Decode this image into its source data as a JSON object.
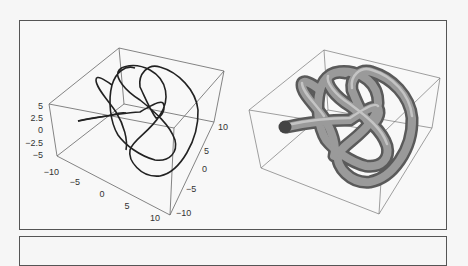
{
  "figure": {
    "left_panel": {
      "title": "space curve",
      "z_ticks": [
        "5",
        "2.5",
        "0",
        "−2.5",
        "−5"
      ],
      "x_ticks": [
        "−10",
        "−5",
        "0",
        "5",
        "10"
      ],
      "y_ticks": [
        "10",
        "5",
        "0",
        "−5",
        "−10"
      ]
    },
    "right_panel": {
      "title": "tube plot"
    }
  }
}
